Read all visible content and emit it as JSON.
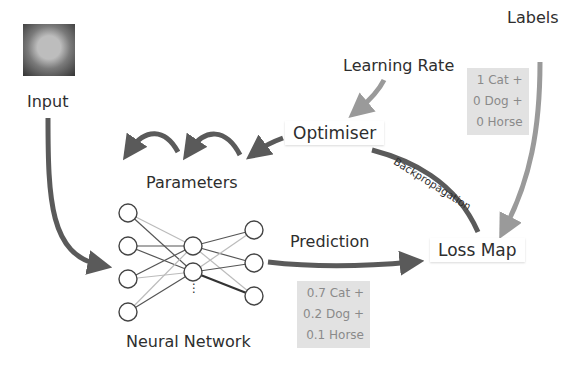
{
  "diagram": {
    "type": "neural-network-training-loop",
    "nodes": {
      "input": {
        "label": "Input",
        "image": "cat-photo"
      },
      "labels": {
        "label": "Labels"
      },
      "learning_rate": {
        "label": "Learning Rate"
      },
      "optimiser": {
        "label": "Optimiser"
      },
      "parameters": {
        "label": "Parameters"
      },
      "neural_network": {
        "label": "Neural Network",
        "layers": [
          4,
          2,
          3
        ],
        "ellipsis": "⋮"
      },
      "loss_map": {
        "label": "Loss Map"
      }
    },
    "edges": {
      "prediction": {
        "label": "Prediction"
      },
      "backpropagation": {
        "label": "Backpropagation"
      }
    },
    "label_box": {
      "lines": [
        "1 Cat +",
        "0 Dog +",
        "0  Horse"
      ]
    },
    "prediction_box": {
      "lines": [
        "0.7 Cat +",
        "0.2 Dog +",
        "0.1  Horse"
      ]
    },
    "colors": {
      "arrow_dark": "#5a5a5a",
      "arrow_light": "#9a9a9a",
      "box_bg": "#e2e2e2"
    }
  }
}
